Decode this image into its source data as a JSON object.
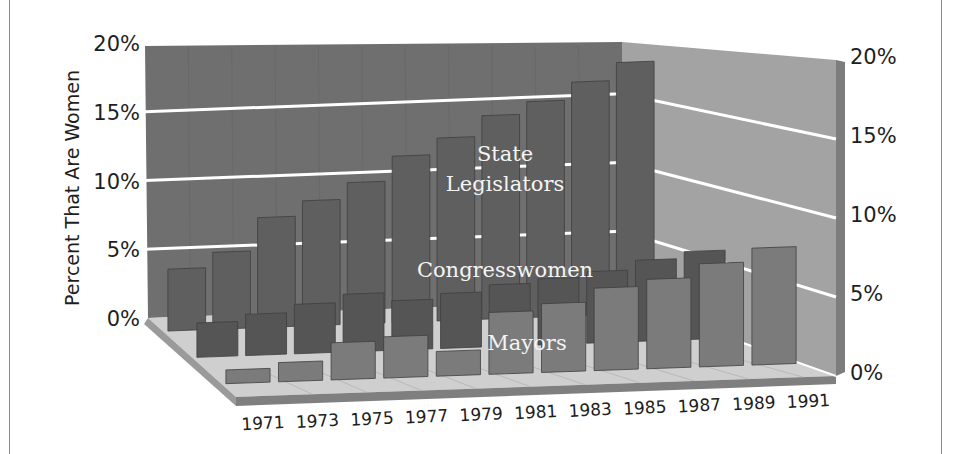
{
  "chart_data": {
    "type": "bar",
    "subtype": "3d-grouped-depth",
    "title": "",
    "xlabel": "",
    "ylabel": "Percent That Are Women",
    "ylim": [
      0,
      20
    ],
    "yticks": [
      "0%",
      "5%",
      "10%",
      "15%",
      "20%"
    ],
    "categories": [
      "1971",
      "1973",
      "1975",
      "1977",
      "1979",
      "1981",
      "1983",
      "1985",
      "1987",
      "1989",
      "1991"
    ],
    "series": [
      {
        "name": "State Legislators",
        "values": [
          4.5,
          5.6,
          8.0,
          9.1,
          10.3,
          12.1,
          13.3,
          14.8,
          15.7,
          17.0,
          18.3
        ]
      },
      {
        "name": "Congresswomen",
        "values": [
          2.5,
          3.0,
          3.6,
          4.2,
          3.6,
          4.0,
          4.5,
          4.8,
          5.2,
          5.9,
          6.4
        ]
      },
      {
        "name": "Mayors",
        "values": [
          1.0,
          1.4,
          2.7,
          3.0,
          1.8,
          4.5,
          5.0,
          6.0,
          6.5,
          7.5,
          8.5
        ]
      }
    ],
    "grid": true,
    "legend": "inline labels on series rows",
    "colors": {
      "State Legislators": "#5d5d5d",
      "Congresswomen": "#545454",
      "Mayors": "#7a7a7a"
    }
  },
  "axis": {
    "left_ticks": [
      "0%",
      "5%",
      "10%",
      "15%",
      "20%"
    ],
    "right_ticks": [
      "0%",
      "5%",
      "10%",
      "15%",
      "20%"
    ],
    "ylabel": "Percent That Are Women"
  },
  "labels": {
    "state": [
      "State",
      "Legislators"
    ],
    "congress": "Congresswomen",
    "mayors": "Mayors"
  },
  "style": {
    "back_wall": "#6f6f6f",
    "side_wall": "#a3a3a3",
    "side_edge": "#7d7d7d",
    "floor": "#cfcfcf",
    "floor_edge": "#7f7f7f",
    "gridline": "#ffffff",
    "text": "#1e1e1e"
  }
}
